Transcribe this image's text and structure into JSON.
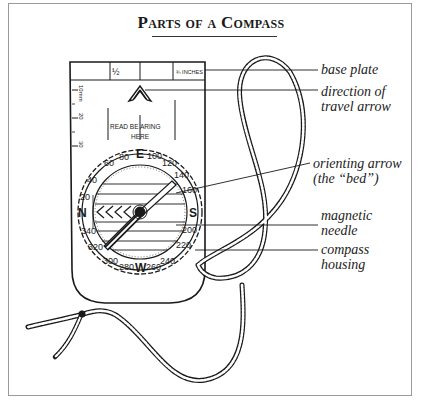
{
  "title": "Parts of a Compass",
  "compass": {
    "top_scale": {
      "half": "½",
      "three_quarter": "¾ INCHES"
    },
    "ruler": [
      "10mm",
      "20",
      "30"
    ],
    "bearing_mark": {
      "line1": "READ BE ARING",
      "line2": "HERE"
    },
    "bezel": {
      "cardinals": {
        "north": "N",
        "east": "E",
        "south": "S",
        "west": "W"
      },
      "degrees": [
        "20",
        "40",
        "60",
        "80",
        "100",
        "120",
        "140",
        "160",
        "200",
        "220",
        "240",
        "260",
        "280",
        "300",
        "320",
        "340"
      ]
    }
  },
  "labels": [
    {
      "id": "base-plate",
      "line1": "base plate",
      "line2": ""
    },
    {
      "id": "direction-of-travel-arrow",
      "line1": "direction of",
      "line2": "travel arrow"
    },
    {
      "id": "orienting-arrow",
      "line1": "orienting arrow",
      "line2": "(the “bed”)"
    },
    {
      "id": "magnetic-needle",
      "line1": "magnetic",
      "line2": "needle"
    },
    {
      "id": "compass-housing",
      "line1": "compass",
      "line2": "housing"
    }
  ],
  "colors": {
    "ink": "#1a1a1a",
    "frame": "#9a9a9a",
    "background": "#ffffff"
  }
}
